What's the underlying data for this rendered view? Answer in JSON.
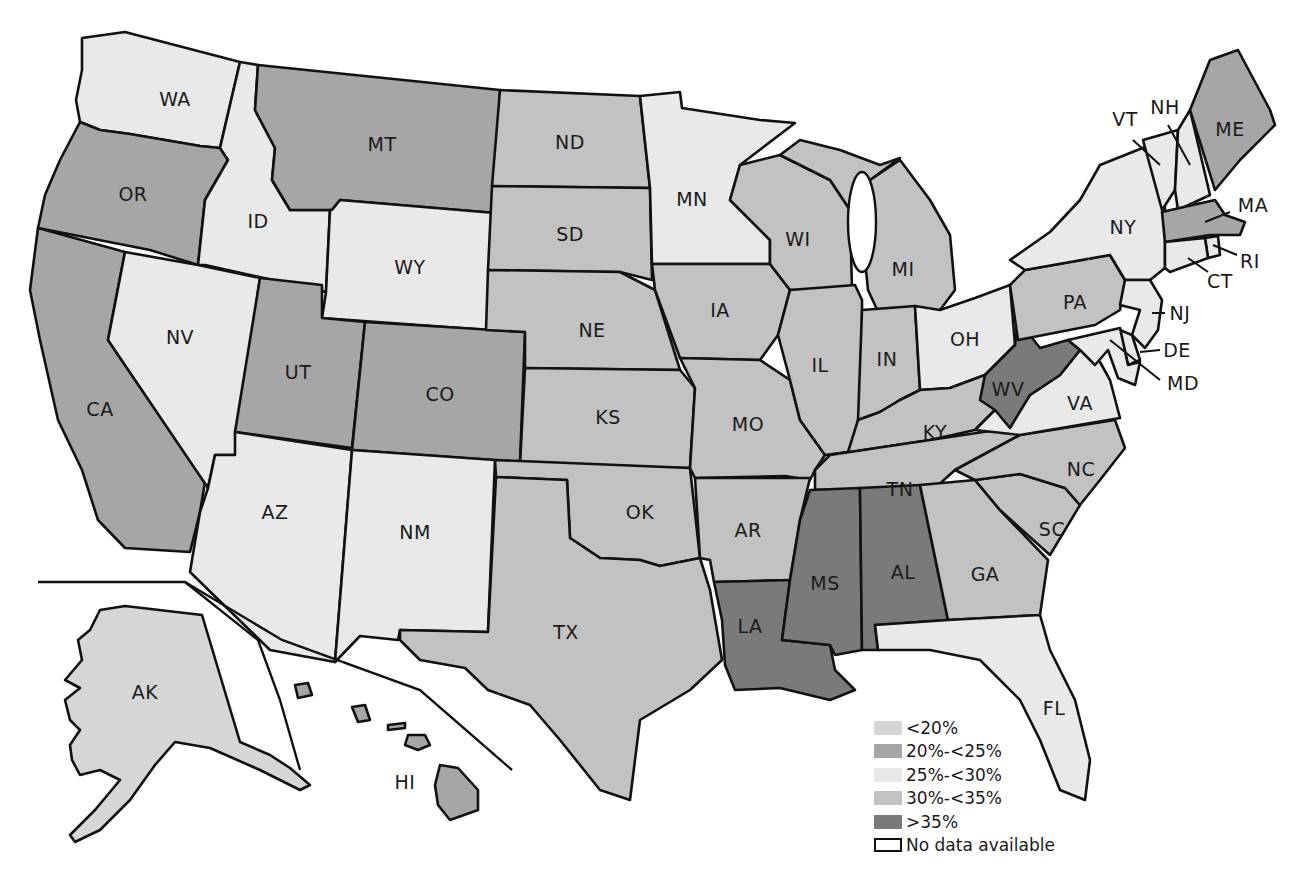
{
  "legend": {
    "items": [
      {
        "label": "<20%",
        "color": "#d6d6d6",
        "key": "lt20"
      },
      {
        "label": "20%-<25%",
        "color": "#a6a6a6",
        "key": "20to25"
      },
      {
        "label": "25%-<30%",
        "color": "#e9e9e9",
        "key": "25to30"
      },
      {
        "label": "30%-<35%",
        "color": "#c2c2c2",
        "key": "30to35"
      },
      {
        "label": ">35%",
        "color": "#7a7a7a",
        "key": "gt35"
      },
      {
        "label": "No data available",
        "color": "#ffffff",
        "key": "nodata",
        "outlined": true
      }
    ]
  },
  "states": {
    "WA": {
      "label": "WA",
      "category": "25to30"
    },
    "OR": {
      "label": "OR",
      "category": "20to25"
    },
    "CA": {
      "label": "CA",
      "category": "20to25"
    },
    "ID": {
      "label": "ID",
      "category": "25to30"
    },
    "NV": {
      "label": "NV",
      "category": "25to30"
    },
    "MT": {
      "label": "MT",
      "category": "20to25"
    },
    "WY": {
      "label": "WY",
      "category": "25to30"
    },
    "UT": {
      "label": "UT",
      "category": "20to25"
    },
    "CO": {
      "label": "CO",
      "category": "20to25"
    },
    "AZ": {
      "label": "AZ",
      "category": "25to30"
    },
    "NM": {
      "label": "NM",
      "category": "25to30"
    },
    "ND": {
      "label": "ND",
      "category": "30to35"
    },
    "SD": {
      "label": "SD",
      "category": "30to35"
    },
    "NE": {
      "label": "NE",
      "category": "30to35"
    },
    "KS": {
      "label": "KS",
      "category": "30to35"
    },
    "OK": {
      "label": "OK",
      "category": "30to35"
    },
    "TX": {
      "label": "TX",
      "category": "30to35"
    },
    "MN": {
      "label": "MN",
      "category": "25to30"
    },
    "IA": {
      "label": "IA",
      "category": "30to35"
    },
    "MO": {
      "label": "MO",
      "category": "30to35"
    },
    "AR": {
      "label": "AR",
      "category": "30to35"
    },
    "LA": {
      "label": "LA",
      "category": "gt35"
    },
    "WI": {
      "label": "WI",
      "category": "30to35"
    },
    "IL": {
      "label": "IL",
      "category": "30to35"
    },
    "MI": {
      "label": "MI",
      "category": "30to35"
    },
    "IN": {
      "label": "IN",
      "category": "30to35"
    },
    "OH": {
      "label": "OH",
      "category": "25to30"
    },
    "KY": {
      "label": "KY",
      "category": "30to35"
    },
    "TN": {
      "label": "TN",
      "category": "30to35"
    },
    "MS": {
      "label": "MS",
      "category": "gt35"
    },
    "AL": {
      "label": "AL",
      "category": "gt35"
    },
    "GA": {
      "label": "GA",
      "category": "30to35"
    },
    "FL": {
      "label": "FL",
      "category": "25to30"
    },
    "SC": {
      "label": "SC",
      "category": "30to35"
    },
    "NC": {
      "label": "NC",
      "category": "30to35"
    },
    "VA": {
      "label": "VA",
      "category": "25to30"
    },
    "WV": {
      "label": "WV",
      "category": "gt35"
    },
    "PA": {
      "label": "PA",
      "category": "30to35"
    },
    "NY": {
      "label": "NY",
      "category": "25to30"
    },
    "VT": {
      "label": "VT",
      "category": "25to30"
    },
    "NH": {
      "label": "NH",
      "category": "25to30"
    },
    "ME": {
      "label": "ME",
      "category": "20to25"
    },
    "MA": {
      "label": "MA",
      "category": "20to25"
    },
    "RI": {
      "label": "RI",
      "category": "25to30"
    },
    "CT": {
      "label": "CT",
      "category": "25to30"
    },
    "NJ": {
      "label": "NJ",
      "category": "25to30"
    },
    "DE": {
      "label": "DE",
      "category": "25to30"
    },
    "MD": {
      "label": "MD",
      "category": "25to30"
    },
    "AK": {
      "label": "AK",
      "category": "lt20"
    },
    "HI": {
      "label": "HI",
      "category": "20to25"
    }
  }
}
